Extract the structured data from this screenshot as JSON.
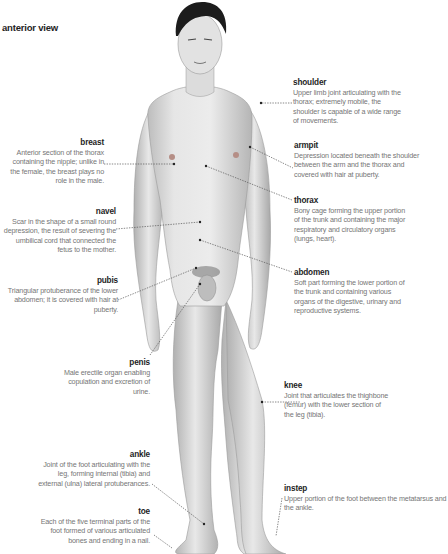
{
  "title": "anterior view",
  "figure": {
    "colors": {
      "skin": "#e4e4e4",
      "skin_shadow": "#b9b9b9",
      "hair": "#1c1c1c",
      "leader": "#555555",
      "term": "#1e1e1e",
      "desc": "#767676"
    }
  },
  "labels": {
    "breast": {
      "term": "breast",
      "desc": "Anterior section of the thorax containing the nipple; unlike in the female, the breast plays no role in the male."
    },
    "navel": {
      "term": "navel",
      "desc": "Scar in the shape of a small round depression, the result of severing the umbilical cord that connected the fetus to the mother."
    },
    "pubis": {
      "term": "pubis",
      "desc": "Triangular protuberance of the lower abdomen; it is covered with hair at puberty."
    },
    "penis": {
      "term": "penis",
      "desc": "Male erectile organ enabling copulation and excretion of urine."
    },
    "ankle": {
      "term": "ankle",
      "desc": "Joint of the foot articulating with the leg, forming internal (tibia) and external (ulna) lateral protuberances."
    },
    "toe": {
      "term": "toe",
      "desc": "Each of the five terminal parts of the foot formed of various articulated bones and ending in a nail."
    },
    "shoulder": {
      "term": "shoulder",
      "desc": "Upper limb joint articulating with the thorax; extremely mobile, the shoulder is capable of a wide range of movements."
    },
    "armpit": {
      "term": "armpit",
      "desc": "Depression located beneath the shoulder between the arm and the thorax and covered with hair at puberty."
    },
    "thorax": {
      "term": "thorax",
      "desc": "Bony cage forming the upper portion of the trunk and containing the major respiratory and circulatory organs (lungs, heart)."
    },
    "abdomen": {
      "term": "abdomen",
      "desc": "Soft part forming the lower portion of the trunk and containing various organs of the digestive, urinary and reproductive systems."
    },
    "knee": {
      "term": "knee",
      "desc": "Joint that articulates the thighbone (femur) with the lower section of the leg (tibia)."
    },
    "instep": {
      "term": "instep",
      "desc": "Upper portion of the foot between the metatarsus and the ankle."
    }
  }
}
